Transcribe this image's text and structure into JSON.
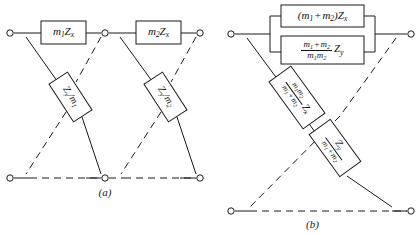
{
  "figure": {
    "stroke_color": "#1a1a1a",
    "background_color": "#ffffff",
    "panels": [
      {
        "id": "a",
        "caption": "(a)",
        "series_boxes": [
          {
            "name": "series-box-1",
            "label": "m1Zx",
            "m_sub": "1",
            "z_sub": "x"
          },
          {
            "name": "series-box-2",
            "label": "m2Zx",
            "m_sub": "2",
            "z_sub": "x"
          }
        ],
        "diagonal_boxes": [
          {
            "name": "diagonal-box-1",
            "label": "Zy/m1",
            "z_sub": "y",
            "m_sub": "1"
          },
          {
            "name": "diagonal-box-2",
            "label": "Zy/m2",
            "z_sub": "y",
            "m_sub": "2"
          }
        ],
        "terminals": [
          {
            "name": "terminal-top-left",
            "x": 10,
            "y": 33
          },
          {
            "name": "terminal-top-mid",
            "x": 105,
            "y": 33
          },
          {
            "name": "terminal-top-right",
            "x": 200,
            "y": 33
          },
          {
            "name": "terminal-bottom-left",
            "x": 10,
            "y": 178
          },
          {
            "name": "terminal-bottom-mid",
            "x": 105,
            "y": 178
          },
          {
            "name": "terminal-bottom-right",
            "x": 200,
            "y": 178
          }
        ]
      },
      {
        "id": "b",
        "caption": "(b)",
        "parallel_boxes": [
          {
            "name": "parallel-box-top",
            "label": "(m1 + m2)Zx"
          },
          {
            "name": "parallel-box-bottom",
            "label": "(m1 + m2)/(m1 m2) Zy"
          }
        ],
        "diagonal_boxes": [
          {
            "name": "diagonal-box-upper",
            "label": "m1 m2/(m1 + m2) Zx"
          },
          {
            "name": "diagonal-box-lower",
            "label": "Zy/(m1 + m2)"
          }
        ],
        "terminals": [
          {
            "name": "terminal-top-left",
            "x": 231,
            "y": 34
          },
          {
            "name": "terminal-top-right",
            "x": 411,
            "y": 34
          },
          {
            "name": "terminal-bottom-left",
            "x": 231,
            "y": 211
          },
          {
            "name": "terminal-bottom-right",
            "x": 411,
            "y": 211
          }
        ]
      }
    ],
    "symbols": {
      "m": "m",
      "Z": "Z",
      "x": "x",
      "y": "y",
      "one": "1",
      "two": "2",
      "plus": "+",
      "slash": "/",
      "paren_open": "(",
      "paren_close": ")"
    }
  }
}
